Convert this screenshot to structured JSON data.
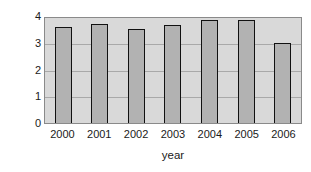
{
  "chart_data": {
    "type": "bar",
    "title": "",
    "xlabel": "year",
    "ylabel": "trillions of yen",
    "categories": [
      "2000",
      "2001",
      "2002",
      "2003",
      "2004",
      "2005",
      "2006"
    ],
    "values": [
      3.6,
      3.7,
      3.5,
      3.65,
      3.85,
      3.85,
      3.0
    ],
    "ylim": [
      0,
      4
    ],
    "yticks": [
      "0",
      "1",
      "2",
      "3",
      "4"
    ],
    "ytick_values": [
      0,
      1,
      2,
      3,
      4
    ],
    "grid": true,
    "legend": false,
    "series": [
      {
        "name": "trillions of yen",
        "values": [
          3.6,
          3.7,
          3.5,
          3.65,
          3.85,
          3.85,
          3.0
        ]
      }
    ]
  },
  "colors": {
    "bar_fill": "#b2b2b2",
    "bar_edge": "#111111",
    "plot_background": "#d9d9d9",
    "gridline": "#a9a9a9",
    "figure_background": "#ffffff",
    "text": "#1a1a1a"
  }
}
